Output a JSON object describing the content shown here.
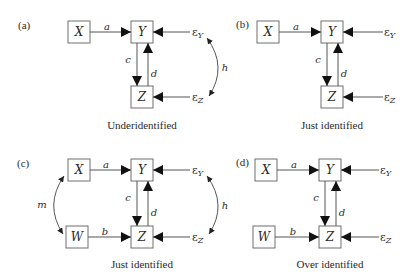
{
  "figure": {
    "panels": [
      {
        "id": "a",
        "label": "(a)",
        "caption": "Underidentified",
        "nodes": {
          "X": "X",
          "Y": "Y",
          "Z": "Z"
        },
        "paths": {
          "a": "a",
          "c": "c",
          "d": "d",
          "h": "h"
        },
        "errors": {
          "eps": "ε",
          "Y_sub": "Y",
          "Z_sub": "Z"
        },
        "edges": [
          "X→Y (a)",
          "Y→Z (c)",
          "Z→Y (d)",
          "εY→Y",
          "εZ→Z",
          "εY↔εZ (h)"
        ]
      },
      {
        "id": "b",
        "label": "(b)",
        "caption": "Just identified",
        "nodes": {
          "X": "X",
          "Y": "Y",
          "Z": "Z"
        },
        "paths": {
          "a": "a",
          "c": "c",
          "d": "d"
        },
        "errors": {
          "eps": "ε",
          "Y_sub": "Y",
          "Z_sub": "Z"
        },
        "edges": [
          "X→Y (a)",
          "Y→Z (c)",
          "Z→Y (d)",
          "εY→Y",
          "εZ→Z"
        ]
      },
      {
        "id": "c",
        "label": "(c)",
        "caption": "Just identified",
        "nodes": {
          "X": "X",
          "Y": "Y",
          "W": "W",
          "Z": "Z"
        },
        "paths": {
          "a": "a",
          "b": "b",
          "c": "c",
          "d": "d",
          "h": "h",
          "m": "m"
        },
        "errors": {
          "eps": "ε",
          "Y_sub": "Y",
          "Z_sub": "Z"
        },
        "edges": [
          "X→Y (a)",
          "W→Z (b)",
          "Y→Z (c)",
          "Z→Y (d)",
          "εY→Y",
          "εZ→Z",
          "εY↔εZ (h)",
          "X↔W (m)"
        ]
      },
      {
        "id": "d",
        "label": "(d)",
        "caption": "Over identified",
        "nodes": {
          "X": "X",
          "Y": "Y",
          "W": "W",
          "Z": "Z"
        },
        "paths": {
          "a": "a",
          "b": "b",
          "c": "c",
          "d": "d"
        },
        "errors": {
          "eps": "ε",
          "Y_sub": "Y",
          "Z_sub": "Z"
        },
        "edges": [
          "X→Y (a)",
          "W→Z (b)",
          "Y→Z (c)",
          "Z→Y (d)",
          "εY→Y",
          "εZ→Z"
        ]
      }
    ]
  }
}
